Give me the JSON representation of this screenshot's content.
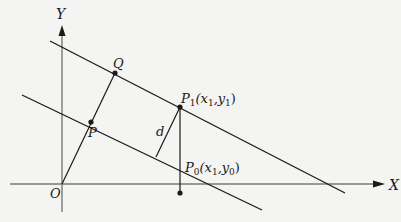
{
  "diagram": {
    "type": "geometry",
    "axes": {
      "x_label": "X",
      "y_label": "Y",
      "origin_label": "O"
    },
    "points": {
      "Q": {
        "label": "Q"
      },
      "P": {
        "label": "P"
      },
      "P1": {
        "label": "P",
        "subscript": "1",
        "coords": "(x",
        "coord_sub1": "1",
        "coord_sep": ",y",
        "coord_sub2": "1",
        "coord_end": ")"
      },
      "P0": {
        "label": "P",
        "subscript": "0",
        "coords": "(x",
        "coord_sub1": "1",
        "coord_sep": ",y",
        "coord_sub2": "0",
        "coord_end": ")"
      }
    },
    "distance_label": "d",
    "colors": {
      "background": "#f4f4f2",
      "line": "#1a1a1a",
      "axis": "#777777"
    }
  }
}
